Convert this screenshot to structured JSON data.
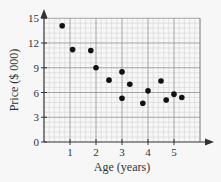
{
  "chart_data": {
    "type": "scatter",
    "title": "",
    "xlabel": "Age (years)",
    "ylabel": "Price ($ 000)",
    "xlim": [
      0,
      6
    ],
    "ylim": [
      0,
      15
    ],
    "xticks": [
      1,
      2,
      3,
      4,
      5
    ],
    "yticks": [
      0,
      3,
      6,
      9,
      12,
      15
    ],
    "grid": true,
    "legend": null,
    "points": [
      {
        "x": 0.7,
        "y": 14.1
      },
      {
        "x": 1.1,
        "y": 11.2
      },
      {
        "x": 1.8,
        "y": 11.1
      },
      {
        "x": 2.0,
        "y": 9.0
      },
      {
        "x": 2.5,
        "y": 7.5
      },
      {
        "x": 3.0,
        "y": 8.5
      },
      {
        "x": 3.0,
        "y": 5.3
      },
      {
        "x": 3.3,
        "y": 7.0
      },
      {
        "x": 3.8,
        "y": 4.7
      },
      {
        "x": 4.0,
        "y": 6.2
      },
      {
        "x": 4.5,
        "y": 7.4
      },
      {
        "x": 4.7,
        "y": 5.1
      },
      {
        "x": 5.0,
        "y": 5.8
      },
      {
        "x": 5.3,
        "y": 5.4
      }
    ],
    "colors": {
      "points": "#111111",
      "axis": "#333333",
      "grid_major": "#9a9a9a",
      "grid_minor": "#d4d4d4",
      "background": "#f7f7f7"
    }
  }
}
